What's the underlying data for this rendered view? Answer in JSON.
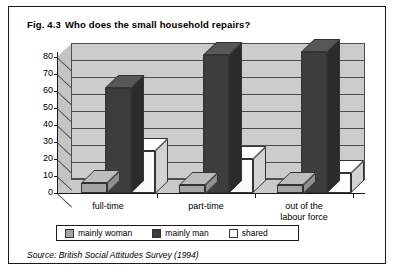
{
  "figure": {
    "number": "Fig. 4.3",
    "title": "Who does the small household repairs?",
    "source": "Source: British Social Attitudes Survey (1994)",
    "border_color": "#1a1a1a"
  },
  "chart_data": {
    "type": "bar",
    "title": "Who does the small household repairs?",
    "xlabel": "",
    "ylabel": "",
    "ylim": [
      0,
      80
    ],
    "yticks": [
      0,
      10,
      20,
      30,
      40,
      50,
      60,
      70,
      80
    ],
    "ytick_labels": [
      "0",
      "10",
      "20",
      "30",
      "40",
      "50",
      "60",
      "70",
      "80"
    ],
    "grid": true,
    "legend_position": "bottom",
    "style": "3d-clustered-column",
    "categories": [
      "full-time",
      "part-time",
      "out of the\nlabour force"
    ],
    "series": [
      {
        "name": "mainly woman",
        "color": "#a5a5a5",
        "values": [
          6,
          5,
          5
        ]
      },
      {
        "name": "mainly man",
        "color": "#3d3d3d",
        "values": [
          62,
          81,
          83
        ]
      },
      {
        "name": "shared",
        "color": "#fbfbfb",
        "values": [
          25,
          20,
          12
        ]
      }
    ]
  },
  "legend": {
    "items": [
      {
        "label": "mainly woman",
        "color": "#a5a5a5"
      },
      {
        "label": "mainly man",
        "color": "#3d3d3d"
      },
      {
        "label": "shared",
        "color": "#fbfbfb"
      }
    ]
  }
}
